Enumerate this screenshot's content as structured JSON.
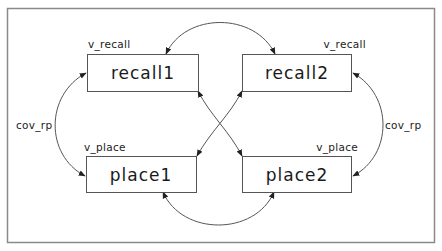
{
  "diagram": {
    "type": "path-diagram",
    "nodes": [
      {
        "id": "recall1",
        "label": "recall1",
        "variance_label": "v_recall"
      },
      {
        "id": "recall2",
        "label": "recall2",
        "variance_label": "v_recall"
      },
      {
        "id": "place1",
        "label": "place1",
        "variance_label": "v_place"
      },
      {
        "id": "place2",
        "label": "place2",
        "variance_label": "v_place"
      }
    ],
    "edges": [
      {
        "from": "recall1",
        "to": "recall2",
        "type": "double-headed",
        "label": ""
      },
      {
        "from": "place1",
        "to": "place2",
        "type": "double-headed",
        "label": ""
      },
      {
        "from": "recall1",
        "to": "place1",
        "type": "double-headed",
        "label": "cov_rp"
      },
      {
        "from": "recall2",
        "to": "place2",
        "type": "double-headed",
        "label": "cov_rp"
      },
      {
        "from": "recall1",
        "to": "place2",
        "type": "double-headed",
        "label": ""
      },
      {
        "from": "recall2",
        "to": "place1",
        "type": "double-headed",
        "label": ""
      }
    ],
    "left_cov_label": "cov_rp",
    "right_cov_label": "cov_rp"
  },
  "colors": {
    "stroke": "#555555",
    "frame": "#8a8a8a",
    "text": "#1a1a1a",
    "background": "#ffffff"
  }
}
